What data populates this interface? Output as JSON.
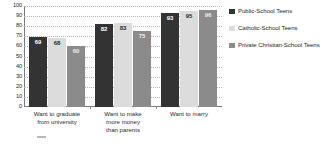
{
  "chart_data": {
    "type": "bar",
    "title": "",
    "subtitle": "",
    "xlabel": "",
    "ylabel": "",
    "ylim": [
      0,
      100
    ],
    "yticks": [
      0,
      10,
      20,
      30,
      40,
      50,
      60,
      70,
      80,
      90,
      100
    ],
    "grid": true,
    "legend_position": "right",
    "categories": [
      "Want to graduate from university",
      "Want to make more money than parents",
      "Want to marry"
    ],
    "category_lines": [
      [
        "Want to graduate",
        "from university"
      ],
      [
        "Want to make",
        "more money",
        "than parents"
      ],
      [
        "Want to marry"
      ]
    ],
    "series": [
      {
        "name": "Public-School Teens",
        "color": "#333333",
        "values": [
          69,
          82,
          93
        ]
      },
      {
        "name": "Catholic-School Teens",
        "color": "#dcdcdc",
        "values": [
          68,
          83,
          95
        ]
      },
      {
        "name": "Private Christian-School Teens",
        "color": "#8b8b8b",
        "values": [
          60,
          75,
          96
        ]
      }
    ]
  },
  "legend": {
    "items": [
      {
        "label": "Public-School Teens",
        "color": "#333333"
      },
      {
        "label": "Catholic-School Teens",
        "color": "#dcdcdc"
      },
      {
        "label": "Private Christian-School Teens",
        "color": "#8b8b8b"
      }
    ]
  },
  "axis": {
    "y_tick_labels": [
      "100",
      "90",
      "80",
      "70",
      "60",
      "50",
      "40",
      "30",
      "20",
      "10",
      "0"
    ]
  }
}
